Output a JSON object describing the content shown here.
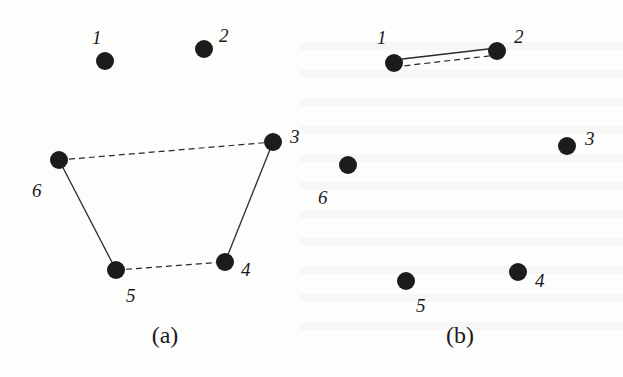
{
  "figure": {
    "colors": {
      "node": "#1c1c1c",
      "edge": "#2a2a2a",
      "background": "#fdfdfc"
    },
    "node_radius": 9,
    "panels": [
      {
        "id": "a",
        "caption": "(a)",
        "caption_pos": [
          165,
          343
        ],
        "nodes": [
          {
            "id": "1",
            "label": "1",
            "x": 105,
            "y": 61,
            "lx": 92,
            "ly": 38
          },
          {
            "id": "2",
            "label": "2",
            "x": 204,
            "y": 49,
            "lx": 219,
            "ly": 36
          },
          {
            "id": "3",
            "label": "3",
            "x": 273,
            "y": 142,
            "lx": 290,
            "ly": 137
          },
          {
            "id": "4",
            "label": "4",
            "x": 225,
            "y": 262,
            "lx": 241,
            "ly": 270
          },
          {
            "id": "5",
            "label": "5",
            "x": 116,
            "y": 270,
            "lx": 126,
            "ly": 296
          },
          {
            "id": "6",
            "label": "6",
            "x": 59,
            "y": 160,
            "lx": 32,
            "ly": 191
          }
        ],
        "edges": [
          {
            "from": "6",
            "to": "3",
            "style": "dashed"
          },
          {
            "from": "6",
            "to": "5",
            "style": "solid"
          },
          {
            "from": "5",
            "to": "4",
            "style": "dashed"
          },
          {
            "from": "4",
            "to": "3",
            "style": "solid"
          }
        ]
      },
      {
        "id": "b",
        "caption": "(b)",
        "caption_pos": [
          460,
          343
        ],
        "nodes": [
          {
            "id": "1",
            "label": "1",
            "x": 394,
            "y": 63,
            "lx": 377,
            "ly": 38
          },
          {
            "id": "2",
            "label": "2",
            "x": 497,
            "y": 51,
            "lx": 514,
            "ly": 37
          },
          {
            "id": "3",
            "label": "3",
            "x": 567,
            "y": 146,
            "lx": 585,
            "ly": 139
          },
          {
            "id": "4",
            "label": "4",
            "x": 518,
            "y": 272,
            "lx": 535,
            "ly": 281
          },
          {
            "id": "5",
            "label": "5",
            "x": 406,
            "y": 281,
            "lx": 416,
            "ly": 306
          },
          {
            "id": "6",
            "label": "6",
            "x": 348,
            "y": 165,
            "lx": 318,
            "ly": 198
          }
        ],
        "edges": [
          {
            "from": "1",
            "to": "2",
            "style": "solid",
            "offset": -3
          },
          {
            "from": "1",
            "to": "2",
            "style": "dashed",
            "offset": 4
          }
        ]
      }
    ]
  }
}
